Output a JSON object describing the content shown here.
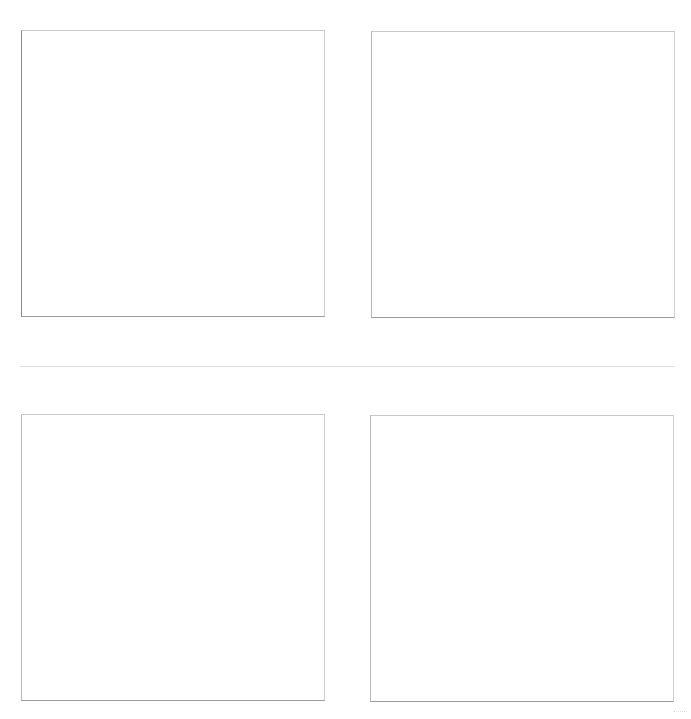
{
  "page": {
    "background": "#ffffff",
    "layout": "2x2 grid of empty framed panels"
  },
  "panels": [
    {
      "position": "top-left",
      "content": ""
    },
    {
      "position": "top-right",
      "content": ""
    },
    {
      "position": "bottom-left",
      "content": ""
    },
    {
      "position": "bottom-right",
      "content": ""
    }
  ],
  "colors": {
    "frame_border": "#c8c8c8",
    "frame_bottom": "#9a9a9a",
    "divider": "#dedede"
  }
}
